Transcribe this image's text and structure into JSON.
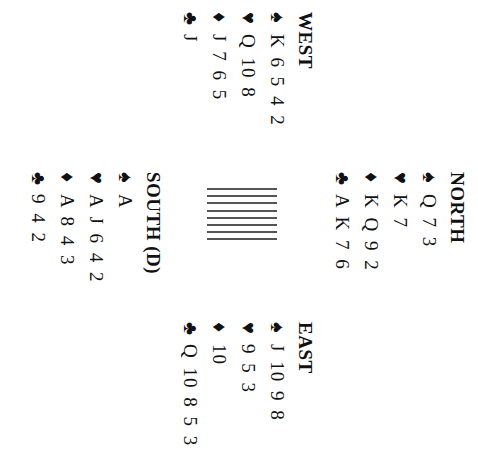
{
  "hands": [
    {
      "id": "west",
      "name": "WEST",
      "suits": [
        {
          "suit": "spades",
          "symbol": "♠",
          "cards": "K 6 5 4 2"
        },
        {
          "suit": "hearts",
          "symbol": "♥",
          "cards": "Q 10 8"
        },
        {
          "suit": "diamonds",
          "symbol": "♦",
          "cards": "J 7 6 5"
        },
        {
          "suit": "clubs",
          "symbol": "♣",
          "cards": "J"
        }
      ]
    },
    {
      "id": "north",
      "name": "NORTH",
      "suits": [
        {
          "suit": "spades",
          "symbol": "♠",
          "cards": "Q 7 3"
        },
        {
          "suit": "hearts",
          "symbol": "♥",
          "cards": "K 7"
        },
        {
          "suit": "diamonds",
          "symbol": "♦",
          "cards": "K Q 9 2"
        },
        {
          "suit": "clubs",
          "symbol": "♣",
          "cards": "A K 7 6"
        }
      ]
    },
    {
      "id": "south",
      "name": "SOUTH (D)",
      "suits": [
        {
          "suit": "spades",
          "symbol": "♠",
          "cards": "A"
        },
        {
          "suit": "hearts",
          "symbol": "♥",
          "cards": "A J 6 4 2"
        },
        {
          "suit": "diamonds",
          "symbol": "♦",
          "cards": "A 8 4 3"
        },
        {
          "suit": "clubs",
          "symbol": "♣",
          "cards": "9 4 2"
        }
      ]
    },
    {
      "id": "east",
      "name": "EAST",
      "suits": [
        {
          "suit": "spades",
          "symbol": "♠",
          "cards": "J 10 9 8"
        },
        {
          "suit": "hearts",
          "symbol": "♥",
          "cards": "9 5 3"
        },
        {
          "suit": "diamonds",
          "symbol": "♦",
          "cards": "10"
        },
        {
          "suit": "clubs",
          "symbol": "♣",
          "cards": "Q 10 8 5 3"
        }
      ]
    }
  ],
  "center": {
    "icon": "card-table-icon"
  }
}
